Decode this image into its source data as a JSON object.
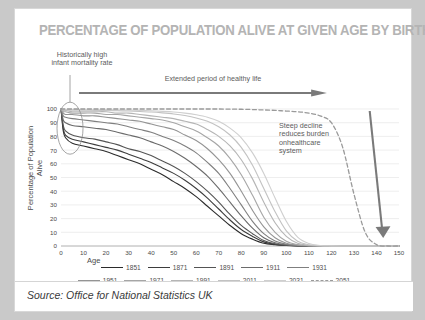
{
  "card": {
    "title": "PERCENTAGE OF POPULATION ALIVE AT GIVEN AGE BY BIRTH YEAR",
    "source": "Source: Office for National Statistics UK"
  },
  "annotations": {
    "infant": "Historically high infant mortality rate",
    "healthy": "Extended period of healthy life",
    "steep": "Steep decline reduces burden onhealthcare system"
  },
  "chart_data": {
    "type": "line",
    "title": "PERCENTAGE OF POPULATION ALIVE AT GIVEN AGE BY BIRTH YEAR",
    "xlabel": "Age",
    "ylabel": "Percentage of Population Alive",
    "xlim": [
      0,
      150
    ],
    "ylim": [
      0,
      100
    ],
    "xticks": [
      0,
      10,
      20,
      30,
      40,
      50,
      60,
      70,
      80,
      90,
      100,
      110,
      120,
      130,
      140,
      150
    ],
    "yticks": [
      0,
      10,
      20,
      30,
      40,
      50,
      60,
      70,
      80,
      90,
      100
    ],
    "grid": true,
    "legend_position": "bottom",
    "x": [
      0,
      1,
      2,
      5,
      10,
      15,
      20,
      25,
      30,
      35,
      40,
      45,
      50,
      55,
      60,
      65,
      70,
      75,
      80,
      85,
      90,
      95,
      100,
      105,
      110,
      115,
      120,
      125,
      130,
      135,
      140,
      145,
      150
    ],
    "series": [
      {
        "name": "1851",
        "color": "#2b2b2b",
        "dash": false,
        "values": [
          100,
          84,
          79,
          75,
          73,
          71,
          69,
          66,
          63,
          60,
          56,
          52,
          47,
          42,
          36,
          29,
          22,
          15,
          9,
          5,
          2,
          1,
          0.4,
          0.1,
          0,
          0,
          0,
          0,
          0,
          0,
          0,
          0,
          0
        ]
      },
      {
        "name": "1871",
        "color": "#3d3d3d",
        "dash": false,
        "values": [
          100,
          86,
          81,
          78,
          76,
          74,
          72,
          70,
          67,
          64,
          61,
          57,
          53,
          48,
          42,
          35,
          27,
          19,
          12,
          7,
          3,
          1.2,
          0.5,
          0.15,
          0,
          0,
          0,
          0,
          0,
          0,
          0,
          0,
          0
        ]
      },
      {
        "name": "1891",
        "color": "#545454",
        "dash": false,
        "values": [
          100,
          88,
          84,
          81,
          79,
          78,
          76,
          74,
          71,
          69,
          66,
          62,
          58,
          53,
          47,
          40,
          32,
          23,
          15,
          9,
          4,
          1.6,
          0.6,
          0.2,
          0,
          0,
          0,
          0,
          0,
          0,
          0,
          0,
          0
        ]
      },
      {
        "name": "1911",
        "color": "#6b6b6b",
        "dash": false,
        "values": [
          100,
          92,
          90,
          88,
          87,
          86,
          85,
          83,
          81,
          79,
          76,
          73,
          69,
          64,
          58,
          51,
          42,
          32,
          22,
          13,
          6,
          2.4,
          0.9,
          0.3,
          0,
          0,
          0,
          0,
          0,
          0,
          0,
          0,
          0
        ]
      },
      {
        "name": "1931",
        "color": "#7f7f7f",
        "dash": false,
        "values": [
          100,
          95,
          94,
          93,
          92,
          91,
          90,
          89,
          87,
          85,
          83,
          80,
          77,
          73,
          68,
          61,
          53,
          42,
          30,
          18,
          9,
          3.6,
          1.3,
          0.4,
          0.1,
          0,
          0,
          0,
          0,
          0,
          0,
          0,
          0
        ]
      },
      {
        "name": "1951",
        "color": "#949494",
        "dash": false,
        "values": [
          100,
          97,
          96,
          96,
          95,
          95,
          94,
          93,
          92,
          91,
          89,
          87,
          85,
          81,
          77,
          71,
          63,
          53,
          40,
          26,
          14,
          6,
          2,
          0.6,
          0.15,
          0,
          0,
          0,
          0,
          0,
          0,
          0,
          0
        ]
      },
      {
        "name": "1971",
        "color": "#a6a6a6",
        "dash": false,
        "values": [
          100,
          98,
          98,
          97,
          97,
          97,
          96,
          96,
          95,
          94,
          93,
          92,
          90,
          87,
          84,
          79,
          73,
          64,
          52,
          37,
          21,
          10,
          3.5,
          1,
          0.25,
          0,
          0,
          0,
          0,
          0,
          0,
          0,
          0
        ]
      },
      {
        "name": "1991",
        "color": "#b5b5b5",
        "dash": false,
        "values": [
          100,
          99,
          99,
          98,
          98,
          98,
          98,
          97,
          97,
          96,
          95,
          94,
          93,
          91,
          89,
          85,
          80,
          73,
          63,
          49,
          32,
          17,
          7,
          2,
          0.5,
          0.1,
          0,
          0,
          0,
          0,
          0,
          0,
          0
        ]
      },
      {
        "name": "2011",
        "color": "#c2c2c2",
        "dash": false,
        "values": [
          100,
          99.4,
          99.3,
          99.2,
          99.1,
          99,
          99,
          98.8,
          98.5,
          98.2,
          97.8,
          97.2,
          96.4,
          95.2,
          93.5,
          91,
          87,
          81,
          72,
          59,
          42,
          25,
          11,
          3.5,
          0.9,
          0.2,
          0,
          0,
          0,
          0,
          0,
          0,
          0
        ]
      },
      {
        "name": "2031",
        "color": "#cfcfcf",
        "dash": false,
        "values": [
          100,
          99.7,
          99.6,
          99.6,
          99.5,
          99.5,
          99.4,
          99.3,
          99.2,
          99,
          98.7,
          98.3,
          97.8,
          97,
          95.8,
          94,
          91,
          86,
          79,
          68,
          53,
          35,
          18,
          6.5,
          1.8,
          0.4,
          0.1,
          0,
          0,
          0,
          0,
          0,
          0
        ]
      },
      {
        "name": "2051",
        "color": "#9a9a9a",
        "dash": true,
        "values": [
          100,
          100,
          100,
          100,
          100,
          100,
          100,
          100,
          100,
          100,
          100,
          100,
          100,
          100,
          100,
          100,
          100,
          99.9,
          99.8,
          99.6,
          99.3,
          99,
          98.5,
          98,
          97,
          95,
          90,
          72,
          38,
          10,
          1,
          0,
          0
        ]
      }
    ]
  },
  "legend": {
    "rows": [
      [
        {
          "label": "1851"
        },
        {
          "label": "1871"
        },
        {
          "label": "1891"
        },
        {
          "label": "1911"
        },
        {
          "label": "1931"
        }
      ],
      [
        {
          "label": "1951"
        },
        {
          "label": "1971"
        },
        {
          "label": "1991"
        },
        {
          "label": "2011"
        },
        {
          "label": "2031"
        },
        {
          "label": "2051"
        }
      ]
    ]
  }
}
